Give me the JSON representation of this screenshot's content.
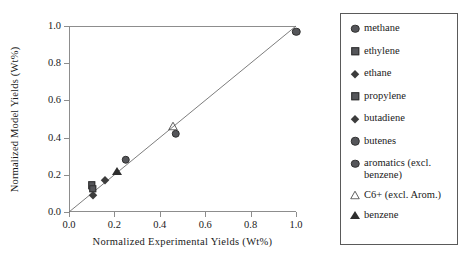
{
  "chart_data": {
    "type": "scatter",
    "title": "",
    "xlabel": "Normalized  Experimental  Yields (Wt%)",
    "ylabel": "Normalized Model Yields (Wt%)",
    "xlim": [
      0.0,
      1.0
    ],
    "ylim": [
      0.0,
      1.0
    ],
    "grid": false,
    "legend_position": "right-outside",
    "reference_line": {
      "name": "parity-line",
      "from": [
        0.0,
        0.0
      ],
      "to": [
        1.0,
        1.0
      ],
      "label": "y = x"
    },
    "xticks": [
      "0.0",
      "0.2",
      "0.4",
      "0.6",
      "0.8",
      "1.0"
    ],
    "xtick_values": [
      0.0,
      0.2,
      0.4,
      0.6,
      0.8,
      1.0
    ],
    "yticks": [
      "0.0",
      "0.2",
      "0.4",
      "0.6",
      "0.8",
      "1.0"
    ],
    "ytick_values": [
      0.0,
      0.2,
      0.4,
      0.6,
      0.8,
      1.0
    ],
    "series": [
      {
        "name": "methane",
        "marker": "circle-filled",
        "color": "#55565a",
        "x": [
          1.0
        ],
        "y": [
          0.97
        ]
      },
      {
        "name": "ethylene",
        "marker": "square-filled",
        "color": "#55565a",
        "x": [
          0.1
        ],
        "y": [
          0.145
        ]
      },
      {
        "name": "ethane",
        "marker": "diamond-small",
        "color": "#3c3c3c",
        "x": [
          0.105
        ],
        "y": [
          0.09
        ]
      },
      {
        "name": "propylene",
        "marker": "square-filled",
        "color": "#55565a",
        "x": [
          0.105
        ],
        "y": [
          0.125
        ]
      },
      {
        "name": "butadiene",
        "marker": "diamond-small",
        "color": "#3c3c3c",
        "x": [
          0.16
        ],
        "y": [
          0.17
        ]
      },
      {
        "name": "butenes",
        "marker": "circle-filled",
        "color": "#55565a",
        "x": [
          0.25
        ],
        "y": [
          0.28
        ]
      },
      {
        "name": "aromatics (excl. benzene)",
        "marker": "circle-filled",
        "color": "#55565a",
        "x": [
          0.47
        ],
        "y": [
          0.42
        ]
      },
      {
        "name": "C6+ (excl. Arom.)",
        "marker": "triangle-open",
        "color": "#4a4a4a",
        "x": [
          0.46
        ],
        "y": [
          0.46
        ]
      },
      {
        "name": "benzene",
        "marker": "triangle-filled",
        "color": "#2e2e2e",
        "x": [
          0.21
        ],
        "y": [
          0.22
        ]
      }
    ]
  },
  "legend": {
    "items": [
      {
        "label": "methane",
        "marker": "circle-filled"
      },
      {
        "label": "ethylene",
        "marker": "square-filled"
      },
      {
        "label": "ethane",
        "marker": "diamond-small"
      },
      {
        "label": "propylene",
        "marker": "square-filled"
      },
      {
        "label": "butadiene",
        "marker": "diamond-small"
      },
      {
        "label": "butenes",
        "marker": "circle-filled"
      },
      {
        "label": "aromatics (excl.\nbenzene)",
        "marker": "circle-filled"
      },
      {
        "label": "C6+ (excl. Arom.)",
        "marker": "triangle-open"
      },
      {
        "label": "benzene",
        "marker": "triangle-filled"
      }
    ]
  },
  "style": {
    "marker_fill": "#55565a",
    "marker_dark": "#2e2e2e",
    "axis_color": "#8d8d8d",
    "line_color": "#6e6e6e",
    "text_color": "#1a1a1a",
    "legend_border": "#5a5a5a",
    "background": "#ffffff"
  }
}
